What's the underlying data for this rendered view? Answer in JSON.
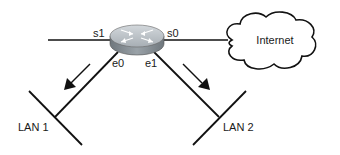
{
  "diagram": {
    "router": {
      "name": "router",
      "interfaces": {
        "s1": "s1",
        "s0": "s0",
        "e0": "e0",
        "e1": "e1"
      }
    },
    "cloud": {
      "label": "Internet"
    },
    "lans": [
      {
        "label": "LAN 1",
        "interface": "e0"
      },
      {
        "label": "LAN 2",
        "interface": "e1"
      }
    ],
    "colors": {
      "line": "#111111",
      "router_top": "#b9c0c6",
      "router_side": "#7f878d",
      "background": "#ffffff"
    }
  }
}
